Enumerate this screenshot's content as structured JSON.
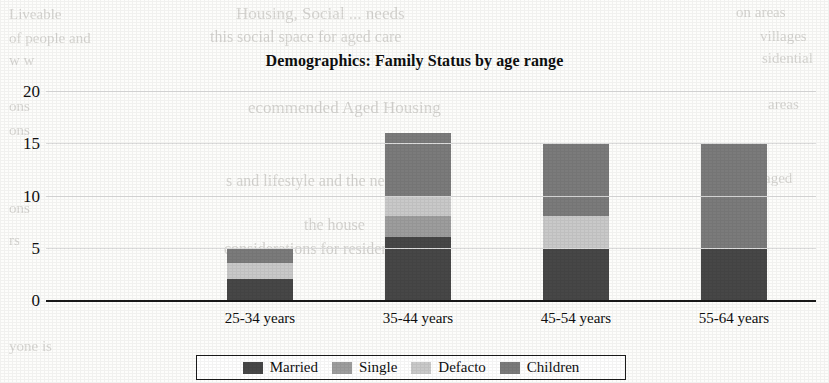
{
  "chart_data": {
    "type": "bar",
    "subtype": "stacked-bar",
    "title": "Demographics: Family Status by age range",
    "xlabel": "",
    "ylabel": "",
    "categories": [
      "25-34 years",
      "35-44 years",
      "45-54 years",
      "55-64 years"
    ],
    "series": [
      {
        "name": "Married",
        "color": "#474747",
        "values": [
          2,
          6,
          5,
          5
        ]
      },
      {
        "name": "Single",
        "color": "#9d9d9d",
        "values": [
          0,
          2,
          0,
          0
        ]
      },
      {
        "name": "Defacto",
        "color": "#c9c9c9",
        "values": [
          1.5,
          2,
          3,
          0
        ]
      },
      {
        "name": "Children",
        "color": "#7b7b7b",
        "values": [
          1.5,
          6,
          7,
          10
        ]
      }
    ],
    "totals": [
      5,
      16,
      15,
      15
    ],
    "ylim": [
      0,
      20
    ],
    "yticks": [
      0,
      5,
      10,
      15,
      20
    ],
    "ytick_labels": [
      "0",
      "5",
      "10",
      "15",
      "20"
    ],
    "grid": true,
    "legend_position": "bottom",
    "legend_entries": [
      "Married",
      "Single",
      "Defacto",
      "Children"
    ]
  },
  "background_text": {
    "lines": [
      {
        "text": "Housing, Social ... needs",
        "x": 236,
        "y": 4,
        "size": 17
      },
      {
        "text": "Liveable",
        "x": 9,
        "y": 6,
        "size": 15
      },
      {
        "text": "on areas",
        "x": 736,
        "y": 4,
        "size": 15
      },
      {
        "text": "this social space for aged care",
        "x": 210,
        "y": 28,
        "size": 16
      },
      {
        "text": "of people and",
        "x": 9,
        "y": 30,
        "size": 15
      },
      {
        "text": "villages",
        "x": 760,
        "y": 28,
        "size": 15
      },
      {
        "text": "w  w",
        "x": 9,
        "y": 52,
        "size": 15
      },
      {
        "text": "sidential",
        "x": 762,
        "y": 50,
        "size": 15
      },
      {
        "text": "ecommended Aged Housing",
        "x": 248,
        "y": 98,
        "size": 17
      },
      {
        "text": "ons",
        "x": 9,
        "y": 98,
        "size": 15
      },
      {
        "text": "areas",
        "x": 768,
        "y": 96,
        "size": 15
      },
      {
        "text": "ons",
        "x": 9,
        "y": 122,
        "size": 15
      },
      {
        "text": "s and lifestyle and the need",
        "x": 226,
        "y": 172,
        "size": 16
      },
      {
        "text": "aged",
        "x": 764,
        "y": 170,
        "size": 15
      },
      {
        "text": "ons",
        "x": 9,
        "y": 200,
        "size": 15
      },
      {
        "text": "the house",
        "x": 304,
        "y": 216,
        "size": 16
      },
      {
        "text": "rs",
        "x": 9,
        "y": 232,
        "size": 15
      },
      {
        "text": "considerations for residents",
        "x": 224,
        "y": 240,
        "size": 16
      },
      {
        "text": "yone is",
        "x": 9,
        "y": 338,
        "size": 15
      }
    ]
  }
}
